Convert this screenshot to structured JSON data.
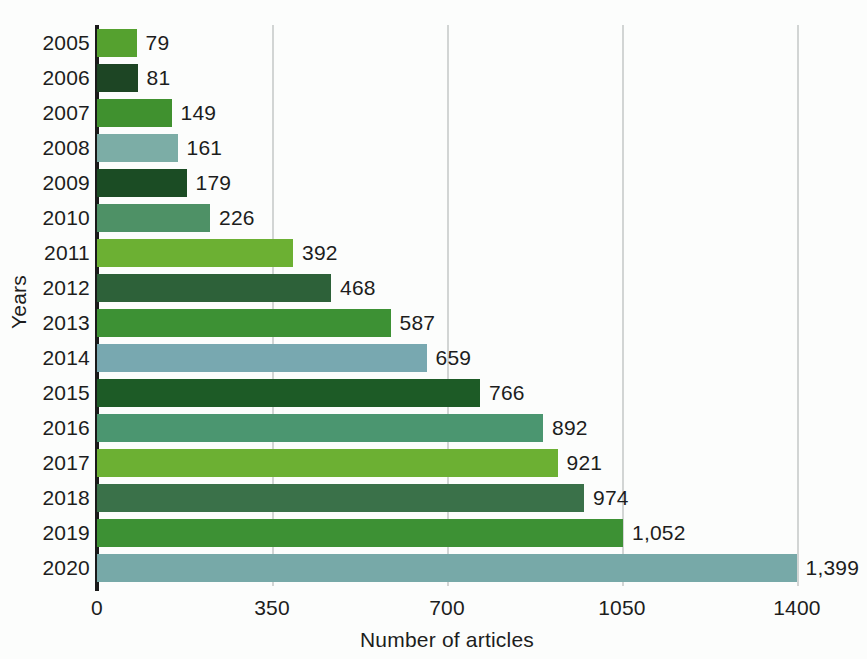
{
  "chart_data": {
    "type": "bar",
    "orientation": "horizontal",
    "title": "",
    "xlabel": "Number of articles",
    "ylabel": "Years",
    "xlim": [
      0,
      1400
    ],
    "xticks": [
      0,
      350,
      700,
      1050,
      1400
    ],
    "xtick_labels": [
      "0",
      "350",
      "700",
      "1050",
      "1400"
    ],
    "grid": true,
    "grid_axis": "x",
    "legend": false,
    "categories": [
      "2005",
      "2006",
      "2007",
      "2008",
      "2009",
      "2010",
      "2011",
      "2012",
      "2013",
      "2014",
      "2015",
      "2016",
      "2017",
      "2018",
      "2019",
      "2020"
    ],
    "values": [
      79,
      81,
      149,
      161,
      179,
      226,
      392,
      468,
      587,
      659,
      766,
      892,
      921,
      974,
      1052,
      1399
    ],
    "value_labels": [
      "79",
      "81",
      "149",
      "161",
      "179",
      "226",
      "392",
      "468",
      "587",
      "659",
      "766",
      "892",
      "921",
      "974",
      "1,052",
      "1,399"
    ],
    "bar_colors": [
      "#55a12f",
      "#1d4524",
      "#40912f",
      "#7cada6",
      "#1b4c24",
      "#4e9166",
      "#6cb033",
      "#2d6139",
      "#3d9134",
      "#78a8b0",
      "#1d5b26",
      "#4b9670",
      "#6cb033",
      "#3a7149",
      "#3d9134",
      "#77a9a8"
    ]
  },
  "axis": {
    "y_title": "Years",
    "x_title": "Number of articles"
  },
  "colors": {
    "background": "#fcfdfc",
    "axis_line": "#1a1a1a",
    "gridline": "#d2d5d4",
    "text": "#1d1d1d"
  }
}
